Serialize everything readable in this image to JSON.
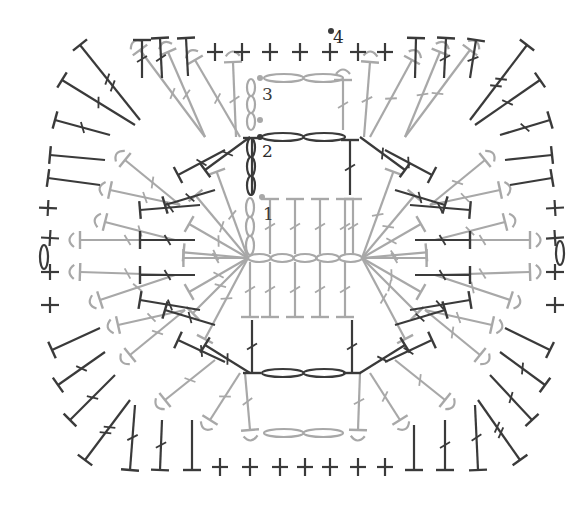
{
  "diagram": {
    "type": "crochet-chart",
    "shape": "rounded-rectangle granny",
    "colors": {
      "dark": "#3a3a3a",
      "light": "#a8a8a8",
      "background": "#ffffff"
    },
    "round_labels": [
      {
        "text": "1",
        "x": 263,
        "y": 215,
        "color": "light"
      },
      {
        "text": "2",
        "x": 262,
        "y": 152,
        "color": "dark"
      },
      {
        "text": "3",
        "x": 262,
        "y": 95,
        "color": "light"
      },
      {
        "text": "4",
        "x": 333,
        "y": 38,
        "color": "dark"
      }
    ],
    "start_markers": [
      {
        "round": 1,
        "x": 262,
        "y": 197,
        "color": "light"
      },
      {
        "round": 2,
        "x": 260,
        "y": 137,
        "color": "dark"
      },
      {
        "round": 3,
        "x": 260,
        "y": 78,
        "color": "light"
      },
      {
        "round": 3,
        "x": 260,
        "y": 120,
        "color": "light"
      },
      {
        "round": 4,
        "x": 331,
        "y": 31,
        "color": "dark"
      }
    ],
    "side_chain_markers": [
      {
        "side": "left",
        "x": 44,
        "y": 257,
        "color": "dark"
      },
      {
        "side": "right",
        "x": 560,
        "y": 253,
        "color": "dark"
      }
    ],
    "foundation_chain": {
      "count": 5,
      "x_start": 248,
      "x_end": 362,
      "y": 258,
      "color": "light"
    },
    "chain_segments": [
      {
        "round": 2,
        "count": 2,
        "x_start": 262,
        "x_end": 345,
        "y": 137,
        "color": "dark"
      },
      {
        "round": 2,
        "count": 2,
        "x_start": 262,
        "x_end": 345,
        "y": 373,
        "color": "dark"
      },
      {
        "round": 3,
        "count": 2,
        "x_start": 264,
        "x_end": 343,
        "y": 78,
        "color": "light"
      },
      {
        "round": 3,
        "count": 2,
        "x_start": 264,
        "x_end": 343,
        "y": 433,
        "color": "light"
      }
    ],
    "vertical_chains": [
      {
        "round": 1,
        "x": 250,
        "y_top": 198,
        "y_bottom": 255,
        "links": 3,
        "color": "light"
      },
      {
        "round": 2,
        "x": 251,
        "y_top": 138,
        "y_bottom": 195,
        "links": 3,
        "color": "dark"
      },
      {
        "round": 3,
        "x": 251,
        "y_top": 79,
        "y_bottom": 130,
        "links": 3,
        "color": "light"
      }
    ],
    "stitch_legend": {
      "chain": "oval",
      "sc": "plus",
      "dc": "T with one slash",
      "tr": "T with two slashes",
      "hdc": "T without slash",
      "fpsc": "arc over post"
    }
  }
}
